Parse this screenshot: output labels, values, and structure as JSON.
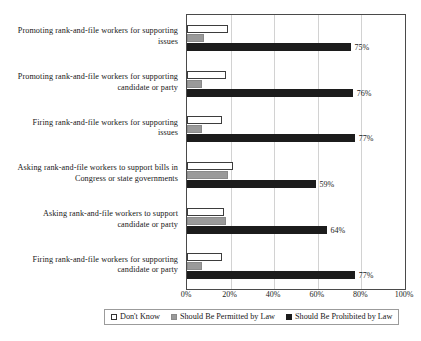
{
  "chart_data": {
    "type": "bar",
    "orientation": "horizontal",
    "title": "",
    "xlabel": "",
    "ylabel": "",
    "xlim": [
      0,
      100
    ],
    "xticks": [
      "0%",
      "20%",
      "40%",
      "60%",
      "80%",
      "100%"
    ],
    "xtick_values": [
      0,
      20,
      40,
      60,
      80,
      100
    ],
    "grid": true,
    "legend_position": "bottom",
    "categories": [
      "Promoting rank-and-file workers for supporting issues",
      "Promoting rank-and-file workers for supporting candidate or party",
      "Firing rank-and-file workers for supporting issues",
      "Asking rank-and-file workers to support bills in Congress or state governments",
      "Asking rank-and-file workers to support candidate or party",
      "Firing rank-and-file workers for supporting candidate or party"
    ],
    "category_lines": [
      [
        "Promoting rank-and-file workers for supporting",
        "issues"
      ],
      [
        "Promoting rank-and-file workers for supporting",
        "candidate or party"
      ],
      [
        "Firing rank-and-file workers for supporting",
        "issues"
      ],
      [
        "Asking rank-and-file workers to support bills in",
        "Congress or state governments"
      ],
      [
        "Asking rank-and-file workers to support",
        "candidate or party"
      ],
      [
        "Firing rank-and-file workers for supporting",
        "candidate or party"
      ]
    ],
    "series": [
      {
        "name": "Don't Know",
        "color": "#ffffff",
        "values": [
          19,
          18,
          16,
          21,
          17,
          16
        ],
        "labels": [
          "",
          "",
          "",
          "",
          "",
          ""
        ]
      },
      {
        "name": "Should Be Permitted by Law",
        "color": "#9a9a9a",
        "values": [
          8,
          7,
          7,
          19,
          18,
          7
        ],
        "labels": [
          "",
          "",
          "",
          "",
          "",
          ""
        ]
      },
      {
        "name": "Should Be Prohibited by Law",
        "color": "#1c1c1c",
        "values": [
          75,
          76,
          77,
          59,
          64,
          77
        ],
        "labels": [
          "75%",
          "76%",
          "77%",
          "59%",
          "64%",
          "77%"
        ]
      }
    ]
  },
  "legend": {
    "items": [
      {
        "label": "Don't Know",
        "swatch": "dk"
      },
      {
        "label": "Should Be Permitted by Law",
        "swatch": "permitted"
      },
      {
        "label": "Should Be Prohibited by Law",
        "swatch": "prohibited"
      }
    ]
  }
}
